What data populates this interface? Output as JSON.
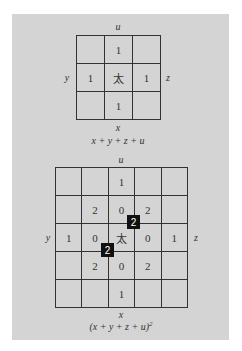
{
  "diagram1": {
    "labels": {
      "top": "u",
      "bottom": "x",
      "left": "y",
      "right": "z"
    },
    "cells": [
      "",
      "1",
      "",
      "1",
      "太",
      "1",
      "",
      "1",
      ""
    ],
    "caption": "x + y + z + u"
  },
  "diagram2": {
    "labels": {
      "top": "u",
      "bottom": "x",
      "left": "y",
      "right": "z"
    },
    "cells": [
      "",
      "",
      "1",
      "",
      "",
      "",
      "2",
      "0",
      "2",
      "",
      "1",
      "0",
      "太",
      "0",
      "1",
      "",
      "2",
      "0",
      "2",
      "",
      "",
      "",
      "1",
      "",
      ""
    ],
    "highlights": [
      "2",
      "2"
    ],
    "caption_base": "(x + y + z + u)",
    "caption_exp": "2"
  }
}
